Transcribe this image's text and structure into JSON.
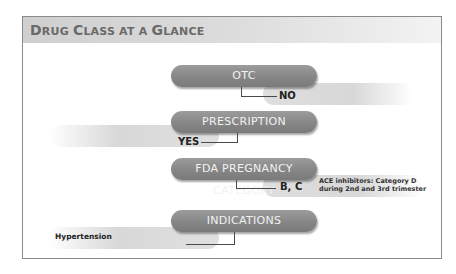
{
  "title": {
    "parts": [
      {
        "cap": "D",
        "rest": "RUG"
      },
      {
        "cap": "C",
        "rest": "LASS"
      },
      {
        "cap": "",
        "rest": "AT A"
      },
      {
        "cap": "G",
        "rest": "LANCE"
      }
    ],
    "text": "Drug Class at a Glance"
  },
  "sections": [
    {
      "label": "OTC",
      "answer": "NO",
      "answer_side": "right"
    },
    {
      "label": "PRESCRIPTION",
      "answer": "YES",
      "answer_side": "left"
    },
    {
      "label": "FDA PREGNANCY CATEGORY",
      "answer": "B, C",
      "answer_side": "right",
      "note": [
        "ACE inhibitors: Category D",
        "during 2nd and 3rd trimester"
      ]
    },
    {
      "label": "INDICATIONS",
      "answer": "Hypertension",
      "answer_side": "left"
    }
  ],
  "colors": {
    "pill": "#868686",
    "pill_text": "#f2f2f2",
    "band": "#d8d8d8",
    "title_text": "#6a6a6a",
    "border": "#8a8a8a"
  }
}
